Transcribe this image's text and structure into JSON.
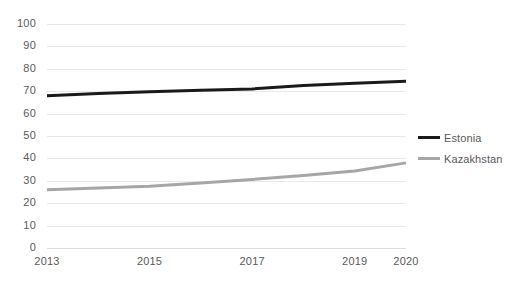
{
  "chart_data": {
    "type": "line",
    "title": "",
    "xlabel": "",
    "ylabel": "",
    "x": [
      2013,
      2014,
      2015,
      2016,
      2017,
      2018,
      2019,
      2020
    ],
    "xtick_labels": [
      "2013",
      "2015",
      "2017",
      "2019",
      "2020"
    ],
    "xtick_values": [
      2013,
      2015,
      2017,
      2019,
      2020
    ],
    "ytick_labels": [
      "0",
      "10",
      "20",
      "30",
      "40",
      "50",
      "60",
      "70",
      "80",
      "90",
      "100"
    ],
    "ytick_values": [
      0,
      10,
      20,
      30,
      40,
      50,
      60,
      70,
      80,
      90,
      100
    ],
    "ylim": [
      0,
      100
    ],
    "xlim": [
      2013,
      2020
    ],
    "grid": "horizontal",
    "legend_position": "right",
    "series": [
      {
        "name": "Estonia",
        "color": "#1a1a1a",
        "width": 3,
        "values": [
          68,
          69,
          69.8,
          70.4,
          71,
          72.6,
          73.6,
          74.4
        ]
      },
      {
        "name": "Kazakhstan",
        "color": "#a6a6a6",
        "width": 3,
        "values": [
          26,
          26.8,
          27.6,
          29,
          30.6,
          32.4,
          34.4,
          38
        ]
      }
    ]
  },
  "legend": {
    "items": [
      {
        "label": "Estonia",
        "swatch": "line-swatch-black"
      },
      {
        "label": "Kazakhstan",
        "swatch": "line-swatch-gray"
      }
    ]
  }
}
